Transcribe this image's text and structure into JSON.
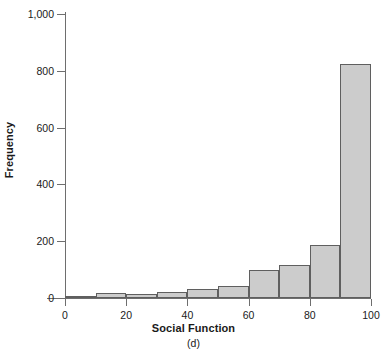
{
  "chart_data": {
    "type": "bar",
    "title": "",
    "subtitle": "",
    "xlabel": "Social Function",
    "ylabel": "Frequency",
    "panel_label": "(d)",
    "categories": [
      "0-10",
      "10-20",
      "20-30",
      "30-40",
      "40-50",
      "50-60",
      "60-70",
      "70-80",
      "80-90",
      "90-100"
    ],
    "bin_edges": [
      0,
      10,
      20,
      30,
      40,
      50,
      60,
      70,
      80,
      90,
      100
    ],
    "values": [
      5,
      18,
      14,
      21,
      32,
      42,
      100,
      118,
      185,
      825
    ],
    "xlim": [
      0,
      100
    ],
    "ylim": [
      0,
      1000
    ],
    "xticks": [
      0,
      20,
      40,
      60,
      80,
      100
    ],
    "xtick_labels": [
      "0",
      "20",
      "40",
      "60",
      "80",
      "100"
    ],
    "yticks": [
      0,
      200,
      400,
      600,
      800,
      1000
    ],
    "ytick_labels": [
      "0",
      "200",
      "400",
      "600",
      "800",
      "1,000"
    ],
    "grid": false,
    "legend": null,
    "bar_fill_color": "#cccccc",
    "bar_edge_color": "#5f5f5f",
    "axis_color": "#6e6e6e"
  }
}
